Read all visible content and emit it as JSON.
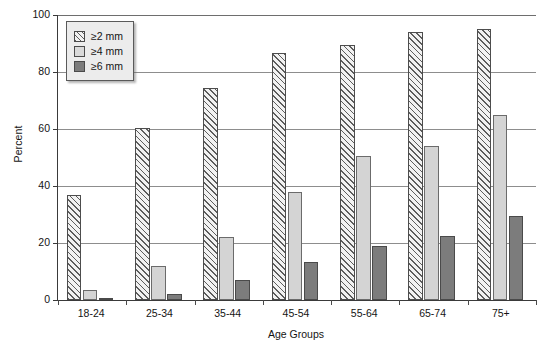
{
  "chart_data": {
    "type": "bar",
    "title": "",
    "subtitle": "",
    "xlabel": "Age Groups",
    "ylabel": "Percent",
    "categories": [
      "18-24",
      "25-34",
      "35-44",
      "45-54",
      "55-64",
      "65-74",
      "75+"
    ],
    "series": [
      {
        "name": "≥2 mm",
        "values": [
          37,
          60.5,
          74.5,
          86.5,
          89.5,
          94,
          95
        ]
      },
      {
        "name": "≥4 mm",
        "values": [
          3.5,
          12,
          22,
          38,
          50.5,
          54,
          65
        ]
      },
      {
        "name": "≥6 mm",
        "values": [
          0.5,
          2,
          7,
          13.5,
          19,
          22.5,
          29.5
        ]
      }
    ],
    "ylim": [
      0,
      100
    ],
    "yticks": [
      0,
      20,
      40,
      60,
      80,
      100
    ],
    "ytick_labels": [
      "0",
      "20",
      "40",
      "60",
      "80",
      "100"
    ],
    "grid": true,
    "grid_axis": "y",
    "legend_position": "upper left",
    "legend_inside_plot": true,
    "colors": {
      "series_1_fill": "#f2f2f2",
      "series_1_hatch": "#5d5d5d",
      "series_2_fill": "#d4d4d4",
      "series_3_fill": "#7c7c7c",
      "axis": "#3a3a3a",
      "gridline": "#8d8d8d",
      "text": "#141414",
      "legend_background": "#ececec"
    }
  },
  "axes": {
    "y_title": "Percent",
    "x_title": "Age Groups"
  },
  "legend": {
    "entries": [
      {
        "label": "≥2 mm"
      },
      {
        "label": "≥4 mm"
      },
      {
        "label": "≥6 mm"
      }
    ]
  }
}
